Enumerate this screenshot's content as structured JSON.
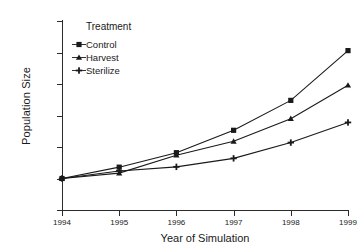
{
  "chart_data": {
    "type": "line",
    "title": "",
    "xlabel": "Year of Simulation",
    "ylabel": "Population Size",
    "x": [
      1994,
      1995,
      1996,
      1997,
      1998,
      1999
    ],
    "xticklabels": [
      "1994",
      "1995",
      "1996",
      "1997",
      "1998",
      "1999"
    ],
    "yticks": [
      500,
      1000,
      1500,
      2000,
      2500,
      3000,
      3500
    ],
    "yticklabels": [
      "500",
      "1000",
      "1500",
      "2000",
      "2500",
      "3000",
      "3500"
    ],
    "ylim": [
      500,
      3500
    ],
    "xlim": [
      1994,
      1999
    ],
    "grid": false,
    "legend_title": "Treatment",
    "legend_position": "upper-left-inside",
    "line_color": "#1a1a1a",
    "series": [
      {
        "name": "Control",
        "marker": "square",
        "values": [
          1000,
          1180,
          1410,
          1765,
          2240,
          3030
        ]
      },
      {
        "name": "Harvest",
        "marker": "triangle",
        "values": [
          1000,
          1085,
          1370,
          1590,
          1950,
          2480
        ]
      },
      {
        "name": "Sterilize",
        "marker": "plus",
        "values": [
          1000,
          1120,
          1185,
          1320,
          1570,
          1890
        ]
      }
    ]
  }
}
